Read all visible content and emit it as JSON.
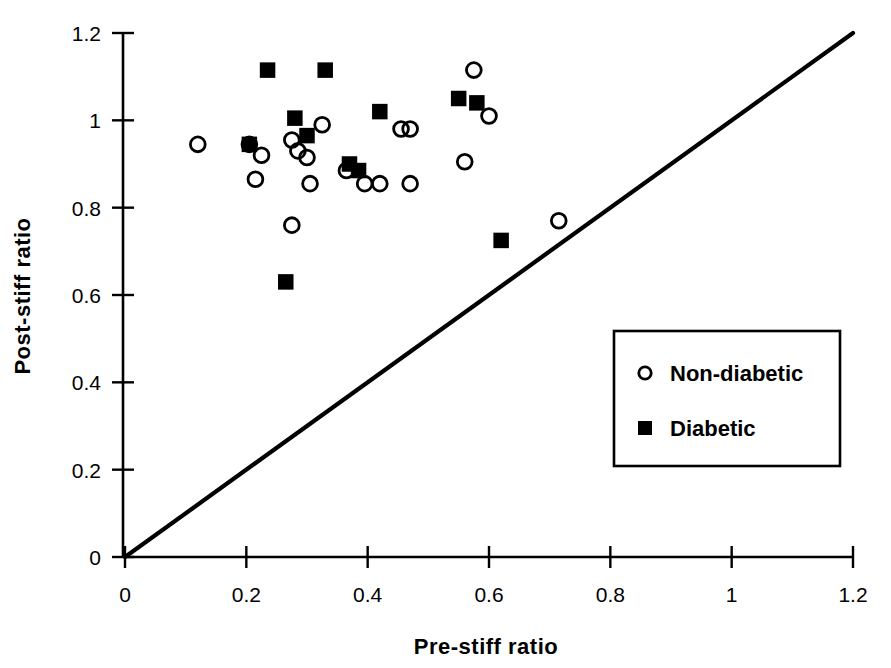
{
  "chart_data": {
    "type": "scatter",
    "title": "",
    "xlabel": "Pre-stiff   ratio",
    "ylabel": "Post-stiff   ratio",
    "xlim": [
      0,
      1.2
    ],
    "ylim": [
      0,
      1.2
    ],
    "xticks": [
      "0",
      "0.2",
      "0.4",
      "0.6",
      "0.8",
      "1",
      "1.2"
    ],
    "xtick_values": [
      0,
      0.2,
      0.4,
      0.6,
      0.8,
      1.0,
      1.2
    ],
    "yticks": [
      "0",
      "0.2",
      "0.4",
      "0.6",
      "0.8",
      "1",
      "1.2"
    ],
    "ytick_values": [
      0,
      0.2,
      0.4,
      0.6,
      0.8,
      1.0,
      1.2
    ],
    "grid": false,
    "legend_position": "lower-right",
    "reference_line": {
      "name": "line-of-identity",
      "from": [
        0,
        0
      ],
      "to": [
        1.2,
        1.2
      ]
    },
    "series": [
      {
        "name": "Non-diabetic",
        "marker": "open-circle",
        "color": "#000000",
        "points": [
          [
            0.12,
            0.945
          ],
          [
            0.205,
            0.945
          ],
          [
            0.225,
            0.92
          ],
          [
            0.215,
            0.865
          ],
          [
            0.275,
            0.955
          ],
          [
            0.275,
            0.76
          ],
          [
            0.285,
            0.93
          ],
          [
            0.3,
            0.915
          ],
          [
            0.305,
            0.855
          ],
          [
            0.325,
            0.99
          ],
          [
            0.365,
            0.885
          ],
          [
            0.395,
            0.855
          ],
          [
            0.42,
            0.855
          ],
          [
            0.455,
            0.98
          ],
          [
            0.47,
            0.98
          ],
          [
            0.47,
            0.855
          ],
          [
            0.56,
            0.905
          ],
          [
            0.575,
            1.115
          ],
          [
            0.6,
            1.01
          ],
          [
            0.715,
            0.77
          ]
        ]
      },
      {
        "name": "Diabetic",
        "marker": "filled-square",
        "color": "#000000",
        "points": [
          [
            0.205,
            0.945
          ],
          [
            0.235,
            1.115
          ],
          [
            0.265,
            0.63
          ],
          [
            0.28,
            1.005
          ],
          [
            0.3,
            0.965
          ],
          [
            0.33,
            1.115
          ],
          [
            0.37,
            0.9
          ],
          [
            0.385,
            0.885
          ],
          [
            0.42,
            1.02
          ],
          [
            0.55,
            1.05
          ],
          [
            0.58,
            1.04
          ],
          [
            0.62,
            0.725
          ]
        ]
      }
    ],
    "legend": [
      {
        "label": "Non-diabetic",
        "marker": "open-circle"
      },
      {
        "label": "Diabetic",
        "marker": "filled-square"
      }
    ]
  }
}
